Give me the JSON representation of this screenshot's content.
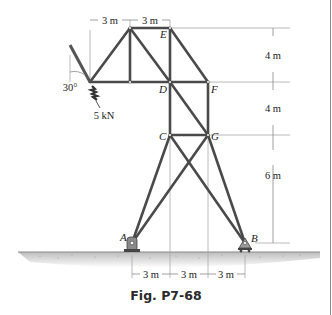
{
  "figure": {
    "caption": "Fig. P7-68",
    "joints": {
      "A": "A",
      "B": "B",
      "C": "C",
      "D": "D",
      "E": "E",
      "F": "F",
      "G": "G"
    },
    "load": {
      "value": "5 kN",
      "angle": "30°"
    },
    "dimensions": {
      "top": [
        "3 m",
        "3 m"
      ],
      "right": [
        "4 m",
        "4 m",
        "6 m"
      ],
      "bottom": [
        "3 m",
        "3 m",
        "3 m"
      ]
    },
    "colors": {
      "member": "#4a4a4a",
      "dimension": "#9a9a9a",
      "ground": "#c8c8c8"
    }
  }
}
